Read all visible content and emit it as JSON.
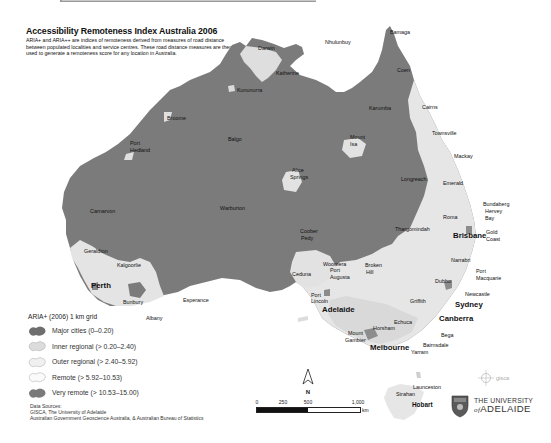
{
  "header": {
    "title": "Accessibility Remoteness Index Australia 2006",
    "description": "ARIA+ and ARIA++ are indices of remoteness derived from measures of road distance between populated localities and service centres. These road distance measures are then used to generate a remoteness score for any location in Australia."
  },
  "map": {
    "places": {
      "darwin": "Darwin",
      "nhulunbuy": "Nhulunbuy",
      "bamaga": "Bamaga",
      "katherine": "Katherine",
      "coen": "Coen",
      "kununurra": "Kununurra",
      "karumba": "Karumba",
      "cairns": "Cairns",
      "broome": "Broome",
      "townsville": "Townsville",
      "balgo": "Balgo",
      "mount_isa_1": "Mount",
      "mount_isa_2": "Isa",
      "mackay": "Mackay",
      "port_hedland_1": "Port",
      "port_hedland_2": "Hedland",
      "alice_1": "Alice",
      "alice_2": "Springs",
      "longreach": "Longreach",
      "emerald": "Emerald",
      "bundaberg": "Bundaberg",
      "hervey_1": "Hervey",
      "hervey_2": "Bay",
      "carnarvon": "Carnarvon",
      "warburton": "Warburton",
      "roma": "Roma",
      "thargomindah": "Thargomindah",
      "brisbane": "Brisbane",
      "gold_1": "Gold",
      "gold_2": "Coast",
      "coober_1": "Coober",
      "coober_2": "Pedy",
      "narrabri": "Narrabri",
      "geraldton": "Geraldton",
      "kalgoorlie": "Kalgoorlie",
      "woomera": "Woomera",
      "broken_1": "Broken",
      "broken_2": "Hill",
      "port_macq_1": "Port",
      "port_macq_2": "Macquarie",
      "ceduna": "Ceduna",
      "port_augusta_1": "Port",
      "port_augusta_2": "Augusta",
      "dubbo": "Dubbo",
      "perth": "Perth",
      "newcastle": "Newcastle",
      "port_lincoln_1": "Port",
      "port_lincoln_2": "Lincoln",
      "griffith": "Griffith",
      "sydney": "Sydney",
      "bunbury": "Bunbury",
      "esperance": "Esperance",
      "adelaide": "Adelaide",
      "albany": "Albany",
      "echuca": "Echuca",
      "canberra": "Canberra",
      "horsham": "Horsham",
      "mount_gambier_1": "Mount",
      "mount_gambier_2": "Gambier",
      "bega": "Bega",
      "melbourne": "Melbourne",
      "bairnsdale": "Bairnsdale",
      "yarram": "Yarram",
      "launceston": "Launceston",
      "strahan": "Strahan",
      "hobart": "Hobart"
    }
  },
  "legend": {
    "title": "ARIA+ (2006) 1 km grid",
    "items": [
      {
        "label": "Major cities (0–0.20)",
        "color": "#6e6e6e"
      },
      {
        "label": "Inner regional (> 0.20–2.40)",
        "color": "#e0e0e0"
      },
      {
        "label": "Outer regional (> 2.40–5.92)",
        "color": "#f2f2f2"
      },
      {
        "label": "Remote (> 5.92–10.53)",
        "color": "#fafafa"
      },
      {
        "label": "Very remote (> 10.53–15.00)",
        "color": "#7a7a7a"
      }
    ]
  },
  "sources": {
    "heading": "Data Sources:",
    "line1": "GISCA, The University of Adelaide",
    "line2": "Australian Government Geoscience Australia, & Australian Bureau of Statistics"
  },
  "scale_bar": {
    "ticks": [
      "0",
      "250",
      "500",
      "1,000"
    ],
    "unit": "km"
  },
  "north_arrow": {
    "label": "N"
  },
  "logos": {
    "gisca": "gisca",
    "university_line1": "THE UNIVERSITY",
    "university_of": "of",
    "university_line2": "ADELAIDE"
  },
  "colors": {
    "very_remote": "#7a7a7a",
    "regional": "#e2e2e2",
    "coastal_light": "#eeeeee"
  }
}
